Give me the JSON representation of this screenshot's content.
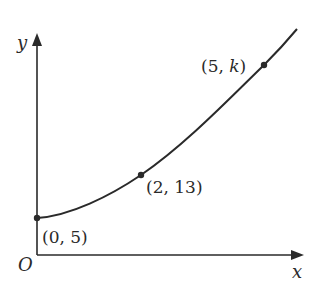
{
  "diagram": {
    "axes": {
      "x_label": "x",
      "y_label": "y",
      "origin_label": "O"
    },
    "points": [
      {
        "label": "(0, 5)",
        "x": 0,
        "y": 5
      },
      {
        "label": "(2, 13)",
        "x": 2,
        "y": 13
      },
      {
        "label_prefix": "(5, ",
        "label_var": "k",
        "label_suffix": ")",
        "x": 5,
        "y": "k"
      }
    ],
    "curve": "increasing convex curve through the marked points",
    "colors": {
      "line": "#2a2a2a",
      "background": "#ffffff"
    }
  }
}
